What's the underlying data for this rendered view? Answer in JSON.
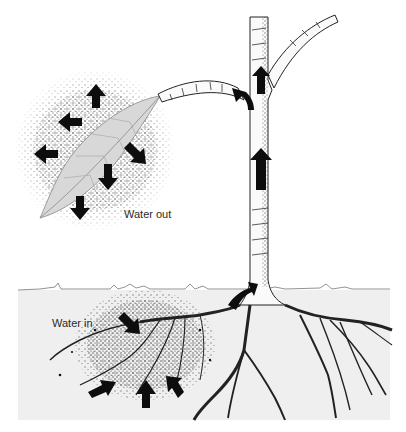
{
  "diagram": {
    "labels": {
      "water_out": "Water out",
      "water_in": "Water in"
    },
    "colors": {
      "background": "#ffffff",
      "soil": "#efefef",
      "ink": "#111111",
      "arrow": "#0d0d0d",
      "label": "#2a2a2a"
    },
    "parts": [
      {
        "name": "leaf",
        "description": "Leaf losing water vapor, surrounded by stippled mist with 7 outward arrows"
      },
      {
        "name": "branch",
        "description": "Branch from trunk to leaf with curved arrow toward leaf"
      },
      {
        "name": "trunk",
        "description": "Vertical stem with upward arrows"
      },
      {
        "name": "upper-branch",
        "description": "Branch curving up-right from trunk"
      },
      {
        "name": "soil",
        "description": "Gray ground region with horizon line"
      },
      {
        "name": "roots",
        "description": "Branching root system with stippled water droplets and 5 inward arrows"
      }
    ],
    "arrows": {
      "leaf_out_count": 7,
      "stem_up_count": 3,
      "root_in_count": 5
    }
  }
}
